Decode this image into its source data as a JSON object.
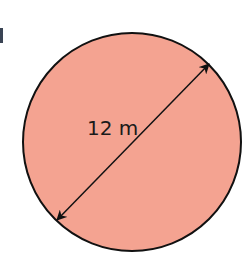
{
  "diagram": {
    "shape": "circle",
    "fill_color": "#f4a391",
    "stroke_color": "#111111",
    "dimension_label": "12 m",
    "dimension_type": "diameter"
  }
}
